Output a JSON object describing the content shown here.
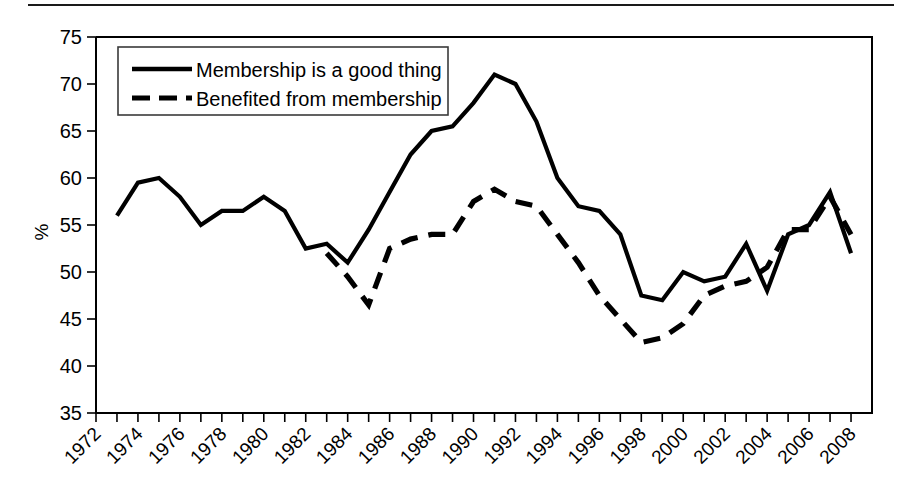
{
  "chart_data": {
    "type": "line",
    "title": "",
    "xlabel": "",
    "ylabel": "%",
    "ylim": [
      35,
      75
    ],
    "ytick_step": 5,
    "yticks": [
      35,
      40,
      45,
      50,
      55,
      60,
      65,
      70,
      75
    ],
    "xlim": [
      1972,
      2009
    ],
    "xticks_labeled": [
      1972,
      1974,
      1976,
      1978,
      1980,
      1982,
      1984,
      1986,
      1988,
      1990,
      1992,
      1994,
      1996,
      1998,
      2000,
      2002,
      2004,
      2006,
      2008
    ],
    "xtick_interval_minor": 1,
    "xtick_label_rotation": 45,
    "grid": false,
    "legend_position": "top-left-inside",
    "line_color": "#000000",
    "series": [
      {
        "name": "Membership is a good thing",
        "style": "solid",
        "x": [
          1973,
          1974,
          1975,
          1976,
          1977,
          1978,
          1979,
          1980,
          1981,
          1982,
          1983,
          1984,
          1985,
          1986,
          1987,
          1988,
          1989,
          1990,
          1991,
          1992,
          1993,
          1994,
          1995,
          1996,
          1997,
          1998,
          1999,
          2000,
          2001,
          2002,
          2003,
          2004,
          2005,
          2006,
          2007,
          2008
        ],
        "values": [
          56.0,
          59.5,
          60.0,
          58.0,
          55.0,
          56.5,
          56.5,
          58.0,
          56.5,
          52.5,
          53.0,
          51.0,
          54.5,
          58.5,
          62.5,
          65.0,
          65.5,
          68.0,
          71.0,
          70.0,
          66.0,
          60.0,
          57.0,
          56.5,
          54.0,
          47.5,
          47.0,
          50.0,
          49.0,
          49.5,
          53.0,
          48.0,
          54.0,
          55.0,
          58.5,
          52.0
        ]
      },
      {
        "name": "Benefited from membership",
        "style": "dashed",
        "x": [
          1983,
          1984,
          1985,
          1986,
          1987,
          1988,
          1989,
          1990,
          1991,
          1992,
          1993,
          1994,
          1995,
          1996,
          1997,
          1998,
          1999,
          2000,
          2001,
          2002,
          2003,
          2004,
          2005,
          2006,
          2007,
          2008
        ],
        "values": [
          52.0,
          49.5,
          46.5,
          52.5,
          53.5,
          54.0,
          54.0,
          57.5,
          58.8,
          57.5,
          57.0,
          54.0,
          51.0,
          47.5,
          45.0,
          42.5,
          43.0,
          44.5,
          47.5,
          48.5,
          49.0,
          50.5,
          54.5,
          54.5,
          58.0,
          54.0
        ]
      }
    ],
    "legend": [
      {
        "label": "Membership is a good thing",
        "style": "solid"
      },
      {
        "label": "Benefited from membership",
        "style": "dashed"
      }
    ]
  },
  "axis": {
    "y_title": "%",
    "y_labels": [
      "75",
      "70",
      "65",
      "60",
      "55",
      "50",
      "45",
      "40",
      "35"
    ],
    "x_labels": [
      "1972",
      "1974",
      "1976",
      "1978",
      "1980",
      "1982",
      "1984",
      "1986",
      "1988",
      "1990",
      "1992",
      "1994",
      "1996",
      "1998",
      "2000",
      "2002",
      "2004",
      "2006",
      "2008"
    ]
  },
  "legend": {
    "item_solid_label": "Membership is a good thing",
    "item_dashed_label": "Benefited from membership"
  }
}
